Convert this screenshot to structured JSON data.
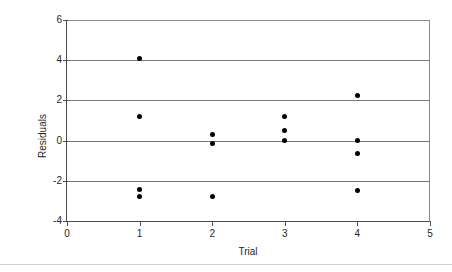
{
  "chart_data": {
    "type": "scatter",
    "title": "",
    "xlabel": "Trial",
    "ylabel": "Residuals",
    "xlim": [
      0,
      5
    ],
    "ylim": [
      -4,
      6
    ],
    "xticks": [
      0,
      1,
      2,
      3,
      4,
      5
    ],
    "yticks": [
      -4,
      -2,
      0,
      2,
      4,
      6
    ],
    "xtick_labels": [
      "0",
      "1",
      "2",
      "3",
      "4",
      "5"
    ],
    "ytick_labels": [
      "-4",
      "-2",
      "0",
      "2",
      "4",
      "6"
    ],
    "grid": "horizontal",
    "legend": null,
    "marker_color": "#000000",
    "marker_shape": "circle",
    "axis_color": "#4d4d4d",
    "gridline_color": "#7a7a7a",
    "background": "#ffffff",
    "points": [
      {
        "x": 1,
        "y": 4.1
      },
      {
        "x": 1,
        "y": 1.2
      },
      {
        "x": 1,
        "y": -2.45
      },
      {
        "x": 1,
        "y": -2.8
      },
      {
        "x": 2,
        "y": 0.28
      },
      {
        "x": 2,
        "y": -0.12
      },
      {
        "x": 2,
        "y": -2.8
      },
      {
        "x": 3,
        "y": 1.2
      },
      {
        "x": 3,
        "y": 0.5
      },
      {
        "x": 3,
        "y": 0.0
      },
      {
        "x": 4,
        "y": 2.25
      },
      {
        "x": 4,
        "y": 0.0
      },
      {
        "x": 4,
        "y": -0.65
      },
      {
        "x": 4,
        "y": -2.5
      }
    ]
  }
}
